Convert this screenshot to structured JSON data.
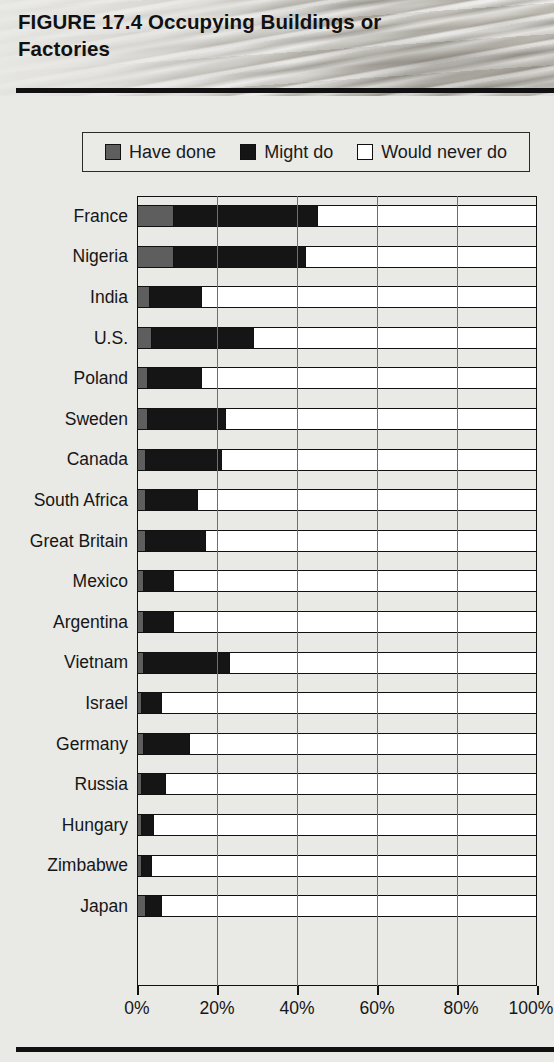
{
  "figure": {
    "number": "FIGURE 17.4",
    "title": "Occupying Buildings or Factories",
    "full_title": "FIGURE 17.4  Occupying Buildings or Factories"
  },
  "legend": {
    "position": "top",
    "items": [
      {
        "label": "Have done",
        "color": "#5e5e5e",
        "icon": "filled-square-gray-icon"
      },
      {
        "label": "Might do",
        "color": "#151515",
        "icon": "filled-square-black-icon"
      },
      {
        "label": "Would never do",
        "color": "#ffffff",
        "icon": "empty-square-white-icon"
      }
    ]
  },
  "chart_data": {
    "type": "bar",
    "orientation": "horizontal",
    "stacked": true,
    "percent": true,
    "title": "FIGURE 17.4  Occupying Buildings or Factories",
    "xlabel": "",
    "ylabel": "",
    "xlim": [
      0,
      100
    ],
    "xticks": [
      0,
      20,
      40,
      60,
      80,
      100
    ],
    "xtick_labels": [
      "0%",
      "20%",
      "40%",
      "60%",
      "80%",
      "100%"
    ],
    "grid": true,
    "grid_axis": "x",
    "legend_position": "top",
    "categories": [
      "France",
      "Nigeria",
      "India",
      "U.S.",
      "Poland",
      "Sweden",
      "Canada",
      "South Africa",
      "Great Britain",
      "Mexico",
      "Argentina",
      "Vietnam",
      "Israel",
      "Germany",
      "Russia",
      "Hungary",
      "Zimbabwe",
      "Japan"
    ],
    "series": [
      {
        "name": "Have done",
        "color": "#5e5e5e",
        "values": [
          9,
          9,
          3,
          3.5,
          2.5,
          2.5,
          2,
          2,
          2,
          1.5,
          1.5,
          1.5,
          1,
          1.5,
          1,
          1,
          1,
          2
        ]
      },
      {
        "name": "Might do",
        "color": "#151515",
        "values": [
          36,
          33,
          13,
          25.5,
          13.5,
          19.5,
          19,
          13,
          15,
          7.5,
          7.5,
          21.5,
          5,
          11.5,
          6,
          3,
          2.5,
          4
        ]
      },
      {
        "name": "Would never do",
        "color": "#ffffff",
        "values": [
          55,
          58,
          84,
          71,
          84,
          78,
          79,
          85,
          83,
          91,
          91,
          77,
          94,
          87,
          93,
          96,
          96.5,
          94
        ]
      }
    ],
    "cumulative_have_plus_might": [
      45,
      42,
      16,
      29,
      16,
      22,
      21,
      15,
      17,
      9,
      9,
      23,
      6,
      13,
      7,
      4,
      3.5,
      6
    ]
  }
}
